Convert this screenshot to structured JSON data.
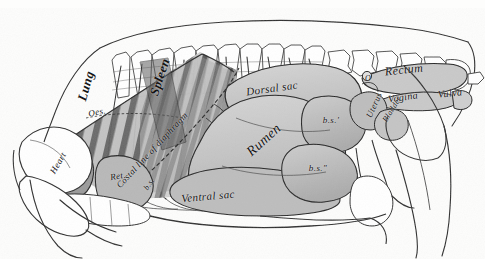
{
  "figure": {
    "view": "Left side topography of thoracic and abdominal viscera",
    "background_color": "#fdfdfc",
    "ink_color": "#1a1a1a",
    "organ_fill_color": "#c6c6c6",
    "shadow_fill_color": "#8e8e8e",
    "dark_fill_color": "#3a3a3a",
    "width": 485,
    "height": 259
  },
  "labels": [
    {
      "id": "lung",
      "text": "Lung",
      "x": 86,
      "y": 86,
      "size": 13,
      "rotate": -74,
      "weight": "700"
    },
    {
      "id": "oesophagus",
      "text": "Oes.",
      "x": 97,
      "y": 112,
      "size": 9,
      "rotate": -12,
      "weight": "400"
    },
    {
      "id": "spleen",
      "text": "Spleen",
      "x": 160,
      "y": 77,
      "size": 13,
      "rotate": -72,
      "weight": "700"
    },
    {
      "id": "diaphragm",
      "text": "Costal line of diaphragm",
      "x": 152,
      "y": 150,
      "size": 9,
      "rotate": -47,
      "weight": "400"
    },
    {
      "id": "heart",
      "text": "Heart",
      "x": 58,
      "y": 163,
      "size": 9,
      "rotate": -60,
      "weight": "400"
    },
    {
      "id": "reticulum",
      "text": "Ret.",
      "x": 118,
      "y": 176,
      "size": 9,
      "rotate": -10,
      "weight": "400"
    },
    {
      "id": "bs-lower-left",
      "text": "b.s.",
      "x": 149,
      "y": 184,
      "size": 8,
      "rotate": -55,
      "weight": "400"
    },
    {
      "id": "dorsal-sac",
      "text": "Dorsal sac",
      "x": 272,
      "y": 88,
      "size": 11,
      "rotate": -8,
      "weight": "400"
    },
    {
      "id": "rumen",
      "text": "Rumen",
      "x": 264,
      "y": 140,
      "size": 14,
      "rotate": -42,
      "weight": "400"
    },
    {
      "id": "ventral-sac",
      "text": "Ventral sac",
      "x": 208,
      "y": 196,
      "size": 11,
      "rotate": -5,
      "weight": "400"
    },
    {
      "id": "bs-prime",
      "text": "b.s.'",
      "x": 331,
      "y": 120,
      "size": 9,
      "rotate": 0,
      "weight": "400"
    },
    {
      "id": "bs-double",
      "text": "b.s.\"",
      "x": 318,
      "y": 168,
      "size": 9,
      "rotate": 0,
      "weight": "400"
    },
    {
      "id": "rectum",
      "text": "Rectum",
      "x": 404,
      "y": 70,
      "size": 12,
      "rotate": -6,
      "weight": "400"
    },
    {
      "id": "vagina",
      "text": "Vagina",
      "x": 403,
      "y": 97,
      "size": 10,
      "rotate": -8,
      "weight": "400"
    },
    {
      "id": "vulva",
      "text": "Vulva",
      "x": 450,
      "y": 93,
      "size": 10,
      "rotate": -6,
      "weight": "400"
    },
    {
      "id": "uterus",
      "text": "Uterus",
      "x": 374,
      "y": 105,
      "size": 9,
      "rotate": -66,
      "weight": "400"
    },
    {
      "id": "bladder",
      "text": "Bladder",
      "x": 392,
      "y": 109,
      "size": 8,
      "rotate": -58,
      "weight": "400"
    },
    {
      "id": "ovary",
      "text": "O",
      "x": 368,
      "y": 78,
      "size": 8,
      "rotate": 0,
      "weight": "400"
    }
  ],
  "anatomy_parts": [
    "thoracic-vertebrae",
    "lumbar-vertebrae",
    "sacrum",
    "ribs",
    "sternum",
    "scapula",
    "humerus",
    "foreleg",
    "pelvis",
    "femur",
    "hindleg",
    "lung",
    "heart",
    "oesophagus",
    "spleen",
    "diaphragm",
    "rumen-dorsal-sac",
    "rumen-ventral-sac",
    "blind-sacs",
    "reticulum",
    "rectum",
    "uterus",
    "ovary",
    "bladder",
    "vagina",
    "vulva",
    "udder"
  ]
}
